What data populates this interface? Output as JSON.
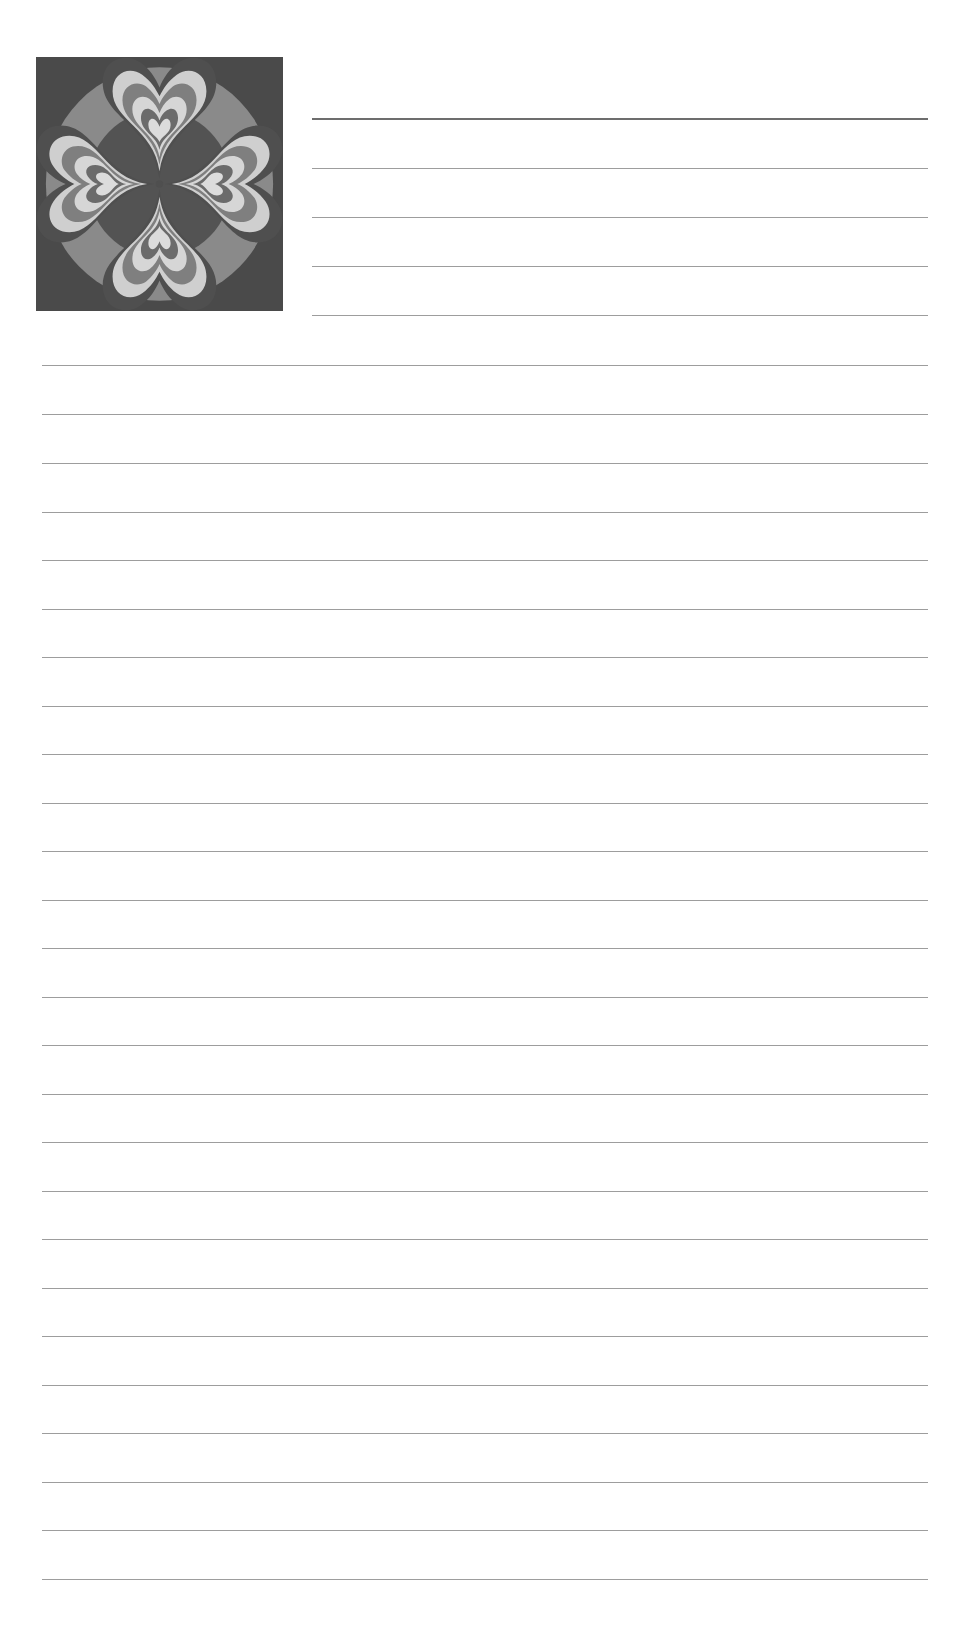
{
  "page": {
    "type": "ruled-notebook-page",
    "width": 965,
    "height": 1626,
    "background_color": "#ffffff",
    "title": ""
  },
  "artwork": {
    "name": "heart-mandala-tile",
    "description": "Grayscale kaleidoscopic four-petal heart mandala on a square tile",
    "alt_text": "Four nested hearts arranged radially inside a circle on a dark square background",
    "x": 36,
    "y": 57,
    "width": 247,
    "height": 254,
    "palette": {
      "background": "#4a4a4a",
      "dark": "#4f4f4f",
      "mid_dark": "#636363",
      "mid": "#848484",
      "light": "#c4c4c4",
      "lightest": "#d9d9d9"
    },
    "petal_count": 4,
    "petal_rotations": [
      0,
      90,
      180,
      270
    ]
  },
  "rules": {
    "line_color": "#9d9d9d",
    "heavy_line_color": "#6d6d6d",
    "short": {
      "left": 312,
      "width": 616,
      "count": 5,
      "positions": [
        118,
        168,
        217,
        266,
        315
      ],
      "heavy_index": 0
    },
    "full": {
      "left": 42,
      "width": 886,
      "count": 26,
      "positions": [
        365,
        414,
        463,
        512,
        560,
        609,
        657,
        706,
        754,
        803,
        851,
        900,
        948,
        997,
        1045,
        1094,
        1142,
        1191,
        1239,
        1288,
        1336,
        1385,
        1433,
        1482,
        1530,
        1579
      ]
    }
  }
}
